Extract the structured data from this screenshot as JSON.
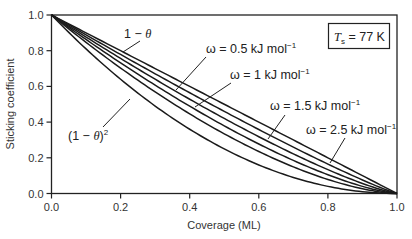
{
  "chart_data": {
    "type": "line",
    "title": "",
    "xlabel": "Coverage (ML)",
    "ylabel": "Sticking coefficient",
    "xlim": [
      0.0,
      1.0
    ],
    "ylim": [
      0.0,
      1.0
    ],
    "xticks": [
      "0.0",
      "0.2",
      "0.4",
      "0.6",
      "0.8",
      "1.0"
    ],
    "yticks": [
      "0.0",
      "0.2",
      "0.4",
      "0.6",
      "0.8",
      "1.0"
    ],
    "grid": false,
    "legend": "none (inline arrow annotations)",
    "annotation_box": {
      "symbol": "T",
      "subscript": "s",
      "text": " = 77 K"
    },
    "x": [
      0.0,
      0.1,
      0.2,
      0.3,
      0.4,
      0.5,
      0.6,
      0.7,
      0.8,
      0.9,
      1.0
    ],
    "series": [
      {
        "name": "1 − θ",
        "exponent": 1.0,
        "values": [
          1.0,
          0.9,
          0.8,
          0.7,
          0.6,
          0.5,
          0.4,
          0.3,
          0.2,
          0.1,
          0.0
        ]
      },
      {
        "name": "ω = 2.5 kJ mol⁻¹",
        "exponent": 1.12,
        "values": [
          1.0,
          0.889,
          0.779,
          0.671,
          0.564,
          0.46,
          0.358,
          0.259,
          0.165,
          0.076,
          0.0
        ]
      },
      {
        "name": "ω = 1.5 kJ mol⁻¹",
        "exponent": 1.25,
        "values": [
          1.0,
          0.877,
          0.757,
          0.64,
          0.528,
          0.42,
          0.318,
          0.222,
          0.134,
          0.056,
          0.0
        ]
      },
      {
        "name": "ω = 1 kJ mol⁻¹",
        "exponent": 1.4,
        "values": [
          1.0,
          0.863,
          0.732,
          0.607,
          0.489,
          0.379,
          0.277,
          0.185,
          0.105,
          0.04,
          0.0
        ]
      },
      {
        "name": "ω = 0.5 kJ mol⁻¹",
        "exponent": 1.58,
        "values": [
          1.0,
          0.847,
          0.703,
          0.569,
          0.446,
          0.335,
          0.235,
          0.149,
          0.078,
          0.026,
          0.0
        ]
      },
      {
        "name": "(1 − θ)²",
        "exponent": 2.0,
        "values": [
          1.0,
          0.81,
          0.64,
          0.49,
          0.36,
          0.25,
          0.16,
          0.09,
          0.04,
          0.01,
          0.0
        ]
      }
    ],
    "annotations": [
      {
        "text_main": "1 − ",
        "text_it": "θ",
        "sup": "",
        "target_series": 0
      },
      {
        "text_main": "ω = 0.5 kJ mol",
        "sup": "−1",
        "target_series": 4
      },
      {
        "text_main": "ω = 1 kJ mol",
        "sup": "−1",
        "target_series": 3
      },
      {
        "text_main": "ω = 1.5 kJ mol",
        "sup": "−1",
        "target_series": 2
      },
      {
        "text_main": "ω = 2.5 kJ mol",
        "sup": "−1",
        "target_series": 1
      },
      {
        "text_main": "(1 − ",
        "text_it": "θ",
        "text_end": ")",
        "sup": "2",
        "target_series": 5
      }
    ],
    "colors": {
      "line": "#1a1a1a",
      "axis": "#222222",
      "text": "#333333",
      "background": "#ffffff"
    }
  }
}
